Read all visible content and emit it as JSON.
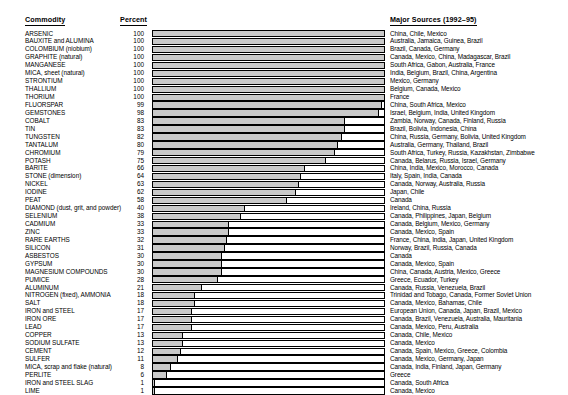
{
  "header": {
    "commodity_label": "Commodity",
    "percent_label": "Percent",
    "sources_label": "Major Sources (1992–95)"
  },
  "chart_data": {
    "type": "bar",
    "title": "",
    "xlabel": "Percent",
    "ylabel": "Commodity",
    "xlim": [
      0,
      100
    ],
    "grid": false,
    "orientation": "horizontal",
    "categories": [
      "ARSENIC",
      "BAUXITE and ALUMINA",
      "COLOMBIUM (niobium)",
      "GRAPHITE (natural)",
      "MANGANESE",
      "MICA, sheet (natural)",
      "STRONTIUM",
      "THALLIUM",
      "THORIUM",
      "FLUORSPAR",
      "GEMSTONES",
      "COBALT",
      "TIN",
      "TUNGSTEN",
      "TANTALUM",
      "CHROMIUM",
      "POTASH",
      "BARITE",
      "STONE (dimension)",
      "NICKEL",
      "IODINE",
      "PEAT",
      "DIAMOND (dust, grit, and powder)",
      "SELENIUM",
      "CADMIUM",
      "ZINC",
      "RARE EARTHS",
      "SILICON",
      "ASBESTOS",
      "GYPSUM",
      "MAGNESIUM COMPOUNDS",
      "PUMICE",
      "ALUMINUM",
      "NITROGEN (fixed), AMMONIA",
      "SALT",
      "IRON and STEEL",
      "IRON ORE",
      "LEAD",
      "COPPER",
      "SODIUM SULFATE",
      "CEMENT",
      "SULFER",
      "MICA, scrap and flake (natural)",
      "PERLITE",
      "IRON and STEEL SLAG",
      "LIME"
    ],
    "values": [
      100,
      100,
      100,
      100,
      100,
      100,
      100,
      100,
      100,
      99,
      98,
      83,
      83,
      82,
      80,
      79,
      75,
      66,
      64,
      63,
      62,
      58,
      40,
      38,
      33,
      33,
      32,
      31,
      30,
      30,
      30,
      28,
      21,
      18,
      18,
      17,
      17,
      17,
      13,
      13,
      12,
      11,
      8,
      6,
      1,
      1
    ],
    "sources": [
      "China, Chile, Mexico",
      "Australia, Jamaica, Guinea, Brazil",
      "Brazil, Canada, Germany",
      "Canada, Mexico, China, Madagascar, Brazil",
      "South Africa, Gabon, Australia, France",
      "India, Belgium, Brazil, China, Argentina",
      "Mexico, Germany",
      "Belgium, Canada, Mexico",
      "France",
      "China, South Africa, Mexico",
      "Israel, Belgium, India, United Kingdom",
      "Zambia, Norway, Canada, Finland, Russia",
      "Brazil, Bolivia, Indonesia, China",
      "China, Russia, Germany, Bolivia, United Kingdom",
      "Australia, Germany, Thailand, Brazil",
      "South Africa, Turkey, Russia, Kazakhstan, Zimbabwe",
      "Canada, Belarus, Russia, Israel, Germany",
      "China, India, Mexico, Morocco, Canada",
      "Italy, Spain, India, Canada",
      "Canada, Norway, Australia, Russia",
      "Japan, Chile",
      "Canada",
      "Ireland, China, Russia",
      "Canada, Philippines, Japan, Belgium",
      "Canada, Belgium, Mexico, Germany",
      "Canada, Mexico, Spain",
      "France, China, India, Japan, United Kingdom",
      "Norway, Brazil, Russia, Canada",
      "Canada",
      "Canada, Mexico, Spain",
      "China, Canada, Austria, Mexico, Greece",
      "Greece, Ecuador, Turkey",
      "Canada, Russia, Venezuela, Brazil",
      "Trinidad and Tobago, Canada, Former Soviet Union",
      "Canada, Mexico, Bahamas, Chile",
      "European Union, Canada, Japan, Brazil, Mexico",
      "Canada, Brazil, Venezuela, Australia, Mauritania",
      "Canada, Mexico, Peru, Australia",
      "Canada, Chile, Mexico",
      "Canada, Mexico",
      "Canada, Spain, Mexico, Greece, Colombia",
      "Canada, Mexico, Germany, Japan",
      "Canada, India, Finland, Japan, Germany",
      "Greece",
      "Canada, South Africa",
      "Canada, Mexico"
    ]
  },
  "colors": {
    "bar_fill": "#c9c9c9",
    "bar_outline": "#000000",
    "text": "#000000",
    "background": "#ffffff"
  }
}
